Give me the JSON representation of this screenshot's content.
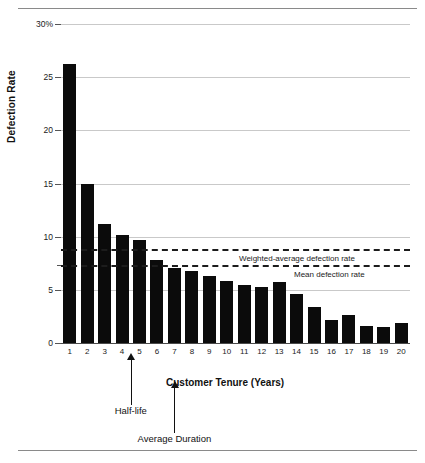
{
  "page": {
    "clipped_header_fragment": "",
    "rule_color": "#8a8a8a"
  },
  "chart_data": {
    "type": "bar",
    "title": "",
    "xlabel": "Customer Tenure (Years)",
    "ylabel": "Defection Rate",
    "categories": [
      "1",
      "2",
      "3",
      "4",
      "5",
      "6",
      "7",
      "8",
      "9",
      "10",
      "11",
      "12",
      "13",
      "14",
      "15",
      "16",
      "17",
      "18",
      "19",
      "20"
    ],
    "values": [
      26.2,
      15.0,
      11.2,
      10.2,
      9.7,
      7.8,
      7.1,
      6.8,
      6.3,
      5.8,
      5.5,
      5.3,
      5.7,
      4.6,
      3.4,
      2.2,
      2.6,
      1.6,
      1.5,
      1.9
    ],
    "ylim": [
      0,
      30
    ],
    "yticks": [
      0,
      5,
      10,
      15,
      20,
      25,
      30
    ],
    "ytick_labels": [
      "0",
      "5",
      "10",
      "15",
      "20",
      "25",
      "30%"
    ],
    "y_minor_ticks": [
      7.3
    ],
    "grid": true,
    "legend": "none",
    "bar_color": "#0b0b0b",
    "reference_lines": [
      {
        "label": "Weighted-average defection rate",
        "value": 8.8,
        "style": "dashed"
      },
      {
        "label": "Mean defection rate",
        "value": 7.3,
        "style": "dashed"
      }
    ],
    "annotations": [
      {
        "label": "Half-life",
        "x_value": 4.5
      },
      {
        "label": "Average Duration",
        "x_value": 7.0
      }
    ]
  }
}
